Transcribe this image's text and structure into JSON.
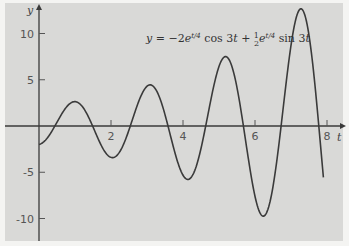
{
  "chart_data": {
    "type": "line",
    "title": "",
    "annotation": "y = −2e^{t/4} cos 3t + ½e^{t/4} sin 3t",
    "xlabel": "t",
    "ylabel": "y",
    "xlim": [
      0,
      8.3
    ],
    "ylim": [
      -12,
      12.5
    ],
    "x_ticks": [
      2,
      4,
      6,
      8
    ],
    "y_ticks": [
      10,
      5,
      -5,
      -10
    ],
    "x_tick_labels": [
      "2",
      "4",
      "6",
      "8"
    ],
    "y_tick_labels": [
      "10",
      "5",
      "-5",
      "-10"
    ],
    "grid": false,
    "legend": null,
    "series": [
      {
        "name": "y(t)",
        "function": "-2*exp(t/4)*cos(3t) + 0.5*exp(t/4)*sin(3t)",
        "t_range": [
          0,
          7.9
        ],
        "x": [
          0,
          0.5,
          1.0,
          1.5,
          2.0,
          2.5,
          3.0,
          3.5,
          4.0,
          4.5,
          5.0,
          5.5,
          6.0,
          6.5,
          7.0,
          7.5,
          7.9
        ],
        "values": [
          -2.0,
          0.32,
          2.4,
          1.0,
          -2.5,
          -1.8,
          3.6,
          4.1,
          -2.8,
          -5.5,
          2.2,
          7.1,
          0.1,
          -9.6,
          -1.4,
          12.3,
          -8.8
        ]
      }
    ],
    "color": "#3a3a3a",
    "background": "#d9d9d7"
  }
}
